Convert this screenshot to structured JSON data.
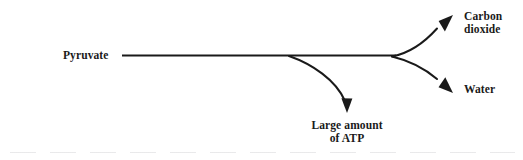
{
  "figure": {
    "type": "metabolic-pathway-flow-diagram",
    "background_color": "#ffffff",
    "ink_color": "#1a1a1a",
    "nodes": {
      "source_label": "Pyruvate",
      "product_co2_line1": "Carbon",
      "product_co2_line2": "dioxide",
      "product_water": "Water",
      "byproduct_line1": "Large amount",
      "byproduct_line2": "of ATP"
    },
    "arrows": [
      {
        "name": "pyruvate-main-line",
        "from": "Pyruvate",
        "to": "fork",
        "style": "straight-horizontal"
      },
      {
        "name": "atp-branch-arrow",
        "from": "main line",
        "to": "Large amount of ATP",
        "style": "curved-down"
      },
      {
        "name": "carbon-dioxide-arrow",
        "from": "fork",
        "to": "Carbon dioxide",
        "style": "curved-up-right"
      },
      {
        "name": "water-arrow",
        "from": "fork",
        "to": "Water",
        "style": "curved-down-right"
      }
    ]
  }
}
